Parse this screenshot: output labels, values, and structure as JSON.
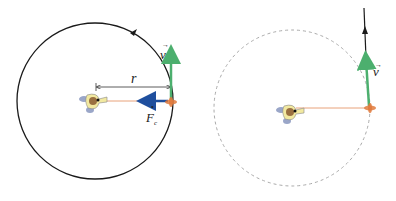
{
  "diagram": {
    "left": {
      "radius_label": "r",
      "velocity_label": "v",
      "force_label": "F",
      "force_subscript": "c",
      "path_style": "solid"
    },
    "right": {
      "velocity_label": "v",
      "path_style": "dashed"
    },
    "colors": {
      "path": "#1a1a1a",
      "velocity": "#4caf6e",
      "force": "#1f4f9e",
      "string": "#e8a27a",
      "object": "#e07a3c",
      "dashed": "#aaaaaa",
      "person_body": "#f2e9a0",
      "person_head": "#9a7040",
      "person_feet": "#9aa6c8"
    }
  }
}
